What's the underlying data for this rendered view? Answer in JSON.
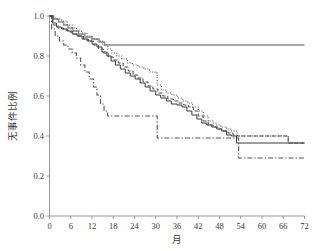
{
  "chart_data": {
    "type": "line",
    "title": "",
    "subtitle": "",
    "xlabel": "月",
    "ylabel": "无事件比例",
    "xlim": [
      0,
      72
    ],
    "ylim": [
      0.0,
      1.0
    ],
    "xticks": [
      0,
      6,
      12,
      18,
      24,
      30,
      36,
      42,
      48,
      54,
      60,
      66,
      72
    ],
    "xtick_labels": [
      "0",
      "6",
      "12",
      "18",
      "24",
      "30",
      "36",
      "42",
      "48",
      "54",
      "60",
      "66",
      "72"
    ],
    "yticks": [
      0.0,
      0.2,
      0.4,
      0.6,
      0.8,
      1.0
    ],
    "ytick_labels": [
      "0.0",
      "0.2",
      "0.4",
      "0.6",
      "0.8",
      "1.0"
    ],
    "grid": false,
    "legend_position": "none",
    "plot_kind": "kaplan-meier-step",
    "series": [
      {
        "name": "curve-gray-solid",
        "style": "solid",
        "color": "#8a8a8a",
        "width": 1.3,
        "points": [
          [
            0,
            1.0
          ],
          [
            1.2,
            0.985
          ],
          [
            2.6,
            0.97
          ],
          [
            4.0,
            0.955
          ],
          [
            5.2,
            0.94
          ],
          [
            6.6,
            0.925
          ],
          [
            8.2,
            0.91
          ],
          [
            10.0,
            0.895
          ],
          [
            12.0,
            0.885
          ],
          [
            14.0,
            0.87
          ],
          [
            15.6,
            0.855
          ],
          [
            72,
            0.855
          ]
        ]
      },
      {
        "name": "curve-dotted",
        "style": "dotted",
        "color": "#555555",
        "width": 1.1,
        "points": [
          [
            0,
            1.0
          ],
          [
            1.0,
            0.99
          ],
          [
            2.0,
            0.985
          ],
          [
            3.4,
            0.975
          ],
          [
            5.0,
            0.955
          ],
          [
            6.4,
            0.94
          ],
          [
            7.6,
            0.925
          ],
          [
            9.0,
            0.915
          ],
          [
            10.6,
            0.9
          ],
          [
            12.0,
            0.885
          ],
          [
            13.4,
            0.875
          ],
          [
            15.0,
            0.855
          ],
          [
            16.4,
            0.835
          ],
          [
            17.6,
            0.815
          ],
          [
            19.0,
            0.8
          ],
          [
            20.4,
            0.785
          ],
          [
            22.0,
            0.765
          ],
          [
            23.4,
            0.755
          ],
          [
            25.0,
            0.745
          ],
          [
            26.6,
            0.735
          ],
          [
            28.2,
            0.72
          ],
          [
            29.8,
            0.715
          ],
          [
            30.4,
            0.655
          ],
          [
            31.6,
            0.63
          ],
          [
            33.0,
            0.615
          ],
          [
            34.6,
            0.605
          ],
          [
            36.2,
            0.59
          ],
          [
            37.6,
            0.575
          ],
          [
            39.0,
            0.565
          ],
          [
            40.4,
            0.545
          ],
          [
            42.0,
            0.525
          ],
          [
            43.4,
            0.5
          ],
          [
            44.8,
            0.475
          ],
          [
            46.2,
            0.465
          ],
          [
            47.0,
            0.455
          ],
          [
            48.4,
            0.445
          ],
          [
            50.0,
            0.435
          ],
          [
            51.4,
            0.425
          ],
          [
            53.0,
            0.4
          ],
          [
            54.4,
            0.4
          ],
          [
            67.0,
            0.4
          ],
          [
            67.4,
            0.365
          ],
          [
            72,
            0.365
          ]
        ]
      },
      {
        "name": "curve-black-solid",
        "style": "solid",
        "color": "#3a3a3a",
        "width": 1.0,
        "points": [
          [
            0,
            1.0
          ],
          [
            0.8,
            0.965
          ],
          [
            2.0,
            0.945
          ],
          [
            3.4,
            0.935
          ],
          [
            5.0,
            0.925
          ],
          [
            6.4,
            0.91
          ],
          [
            7.8,
            0.9
          ],
          [
            9.2,
            0.885
          ],
          [
            10.6,
            0.875
          ],
          [
            12.0,
            0.86
          ],
          [
            13.4,
            0.845
          ],
          [
            14.8,
            0.82
          ],
          [
            16.2,
            0.8
          ],
          [
            17.4,
            0.775
          ],
          [
            18.6,
            0.755
          ],
          [
            20.0,
            0.735
          ],
          [
            21.4,
            0.715
          ],
          [
            22.8,
            0.7
          ],
          [
            24.2,
            0.685
          ],
          [
            25.6,
            0.665
          ],
          [
            27.0,
            0.645
          ],
          [
            28.4,
            0.625
          ],
          [
            30.0,
            0.605
          ],
          [
            31.4,
            0.59
          ],
          [
            33.0,
            0.575
          ],
          [
            34.4,
            0.56
          ],
          [
            36.0,
            0.555
          ],
          [
            37.4,
            0.545
          ],
          [
            38.8,
            0.525
          ],
          [
            40.2,
            0.505
          ],
          [
            41.6,
            0.485
          ],
          [
            43.0,
            0.465
          ],
          [
            44.4,
            0.455
          ],
          [
            45.8,
            0.445
          ],
          [
            47.2,
            0.435
          ],
          [
            48.6,
            0.425
          ],
          [
            50.0,
            0.405
          ],
          [
            51.4,
            0.4
          ],
          [
            52.8,
            0.365
          ],
          [
            53.4,
            0.365
          ],
          [
            72,
            0.365
          ]
        ]
      },
      {
        "name": "curve-dashed",
        "style": "dashed",
        "color": "#4a4a4a",
        "width": 1.0,
        "points": [
          [
            0,
            1.0
          ],
          [
            1.0,
            0.955
          ],
          [
            2.4,
            0.94
          ],
          [
            4.0,
            0.93
          ],
          [
            5.4,
            0.92
          ],
          [
            6.8,
            0.91
          ],
          [
            8.2,
            0.9
          ],
          [
            9.6,
            0.885
          ],
          [
            11.0,
            0.875
          ],
          [
            12.4,
            0.855
          ],
          [
            13.8,
            0.835
          ],
          [
            15.2,
            0.815
          ],
          [
            16.6,
            0.795
          ],
          [
            18.0,
            0.78
          ],
          [
            19.4,
            0.765
          ],
          [
            20.8,
            0.745
          ],
          [
            22.2,
            0.725
          ],
          [
            23.6,
            0.705
          ],
          [
            25.0,
            0.69
          ],
          [
            26.4,
            0.67
          ],
          [
            27.8,
            0.65
          ],
          [
            29.2,
            0.635
          ],
          [
            30.6,
            0.615
          ],
          [
            32.0,
            0.6
          ],
          [
            33.4,
            0.585
          ],
          [
            35.0,
            0.575
          ],
          [
            36.4,
            0.565
          ],
          [
            37.8,
            0.555
          ],
          [
            39.2,
            0.545
          ],
          [
            40.6,
            0.525
          ],
          [
            42.0,
            0.5
          ],
          [
            43.4,
            0.475
          ],
          [
            44.8,
            0.455
          ],
          [
            46.2,
            0.445
          ],
          [
            47.6,
            0.435
          ],
          [
            49.0,
            0.425
          ],
          [
            50.4,
            0.415
          ],
          [
            51.8,
            0.405
          ],
          [
            53.0,
            0.4
          ],
          [
            67.0,
            0.4
          ],
          [
            67.4,
            0.365
          ],
          [
            72,
            0.365
          ]
        ]
      },
      {
        "name": "curve-dashdot",
        "style": "dashdot",
        "color": "#555555",
        "width": 1.1,
        "points": [
          [
            0,
            1.0
          ],
          [
            0.6,
            0.935
          ],
          [
            1.6,
            0.9
          ],
          [
            2.8,
            0.875
          ],
          [
            4.0,
            0.855
          ],
          [
            5.2,
            0.835
          ],
          [
            6.4,
            0.815
          ],
          [
            7.6,
            0.79
          ],
          [
            8.8,
            0.755
          ],
          [
            10.0,
            0.72
          ],
          [
            11.2,
            0.685
          ],
          [
            12.4,
            0.645
          ],
          [
            13.4,
            0.605
          ],
          [
            14.4,
            0.56
          ],
          [
            15.4,
            0.525
          ],
          [
            16.4,
            0.5
          ],
          [
            30.0,
            0.5
          ],
          [
            30.4,
            0.39
          ],
          [
            53.0,
            0.39
          ],
          [
            53.4,
            0.29
          ],
          [
            72,
            0.29
          ]
        ]
      }
    ]
  },
  "axes": {
    "x_axis_name": "month-axis",
    "y_axis_name": "event-free-proportion-axis"
  }
}
